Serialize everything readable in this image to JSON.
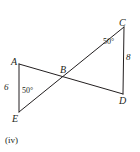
{
  "figure": {
    "caption": "(iv)",
    "stroke_color": "#231f20",
    "background_color": "#ffffff",
    "vertices": [
      {
        "id": "A",
        "label": "A",
        "x": 19,
        "y": 64
      },
      {
        "id": "B",
        "label": "B",
        "x": 63,
        "y": 78
      },
      {
        "id": "C",
        "label": "C",
        "x": 124,
        "y": 27
      },
      {
        "id": "D",
        "label": "D",
        "x": 123,
        "y": 94
      },
      {
        "id": "E",
        "label": "E",
        "x": 19,
        "y": 112
      }
    ],
    "segments": [
      {
        "from": "A",
        "to": "E",
        "name": "segment-AE"
      },
      {
        "from": "A",
        "to": "D",
        "name": "segment-AD"
      },
      {
        "from": "E",
        "to": "C",
        "name": "segment-EC"
      },
      {
        "from": "C",
        "to": "D",
        "name": "segment-CD"
      }
    ],
    "measures": [
      {
        "id": "side-AE",
        "value": "6",
        "on": "AE"
      },
      {
        "id": "side-CD",
        "value": "8",
        "on": "CD"
      }
    ],
    "angles": [
      {
        "id": "angle-at-E",
        "value": "50°",
        "vertex": "E"
      },
      {
        "id": "angle-at-C",
        "value": "50°",
        "vertex": "C"
      }
    ]
  }
}
